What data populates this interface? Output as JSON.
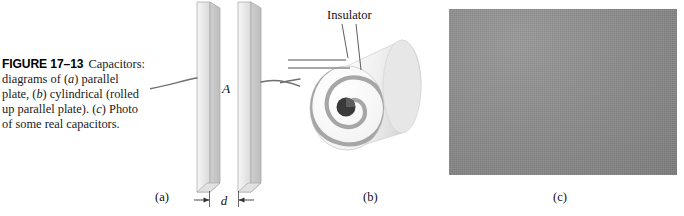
{
  "figure": {
    "number_label": "FIGURE 17–13",
    "caption_text": "Capacitors: diagrams of (a) parallel plate, (b) cylindrical (rolled up parallel plate). (c) Photo of some real capacitors.",
    "caption_parts": {
      "lead": "Capacitors:",
      "line2_pre": "diagrams of (",
      "line2_ital": "a",
      "line2_post": ") parallel",
      "line3_pre": "plate, (",
      "line3_ital": "b",
      "line3_post": ") cylindrical (rolled",
      "line4_pre": "up parallel plate). (",
      "line4_ital": "c",
      "line4_post": ") Photo",
      "line5": "of some real capacitors."
    }
  },
  "panel_a": {
    "name": "parallel-plate-capacitor-diagram",
    "sub_label": "(a)",
    "area_label": "A",
    "gap_label": "d",
    "plate_color": "#e9e9e9",
    "plate_edge_color": "#a8a8a8",
    "plate_side_color": "#cfcfcf",
    "wire_color": "#6f6f6f"
  },
  "panel_b": {
    "name": "cylindrical-rolled-capacitor-diagram",
    "sub_label": "(b)",
    "insulator_label": "Insulator",
    "spiral_color": "#a6a6a6",
    "cylinder_color": "#f2f2f2",
    "cylinder_shadow": "#cdcdcd",
    "core_color": "#3a3a3a",
    "turns": 5,
    "lead_color": "#8a8a8a"
  },
  "panel_c": {
    "name": "real-capacitors-photograph",
    "sub_label": "(c)",
    "background_color": "#8e8e8e",
    "items": [
      {
        "name": "variable-air-capacitor",
        "tone": "#2b2b2b"
      },
      {
        "name": "white-trimmer-capacitor",
        "tone": "#eeeeea"
      },
      {
        "name": "small-variable-capacitor",
        "tone": "#343434"
      },
      {
        "name": "film-capacitor-box",
        "tone": "#3c3c3c"
      },
      {
        "name": "axial-film-capacitor",
        "tone": "#2e2e2e"
      },
      {
        "name": "electrolytic-capacitor",
        "tone": "#1f1f1f"
      },
      {
        "name": "disc-ceramic-capacitor",
        "tone": "#232323"
      },
      {
        "name": "white-ceramic-power-capacitor",
        "tone": "#e6e4de"
      }
    ]
  }
}
